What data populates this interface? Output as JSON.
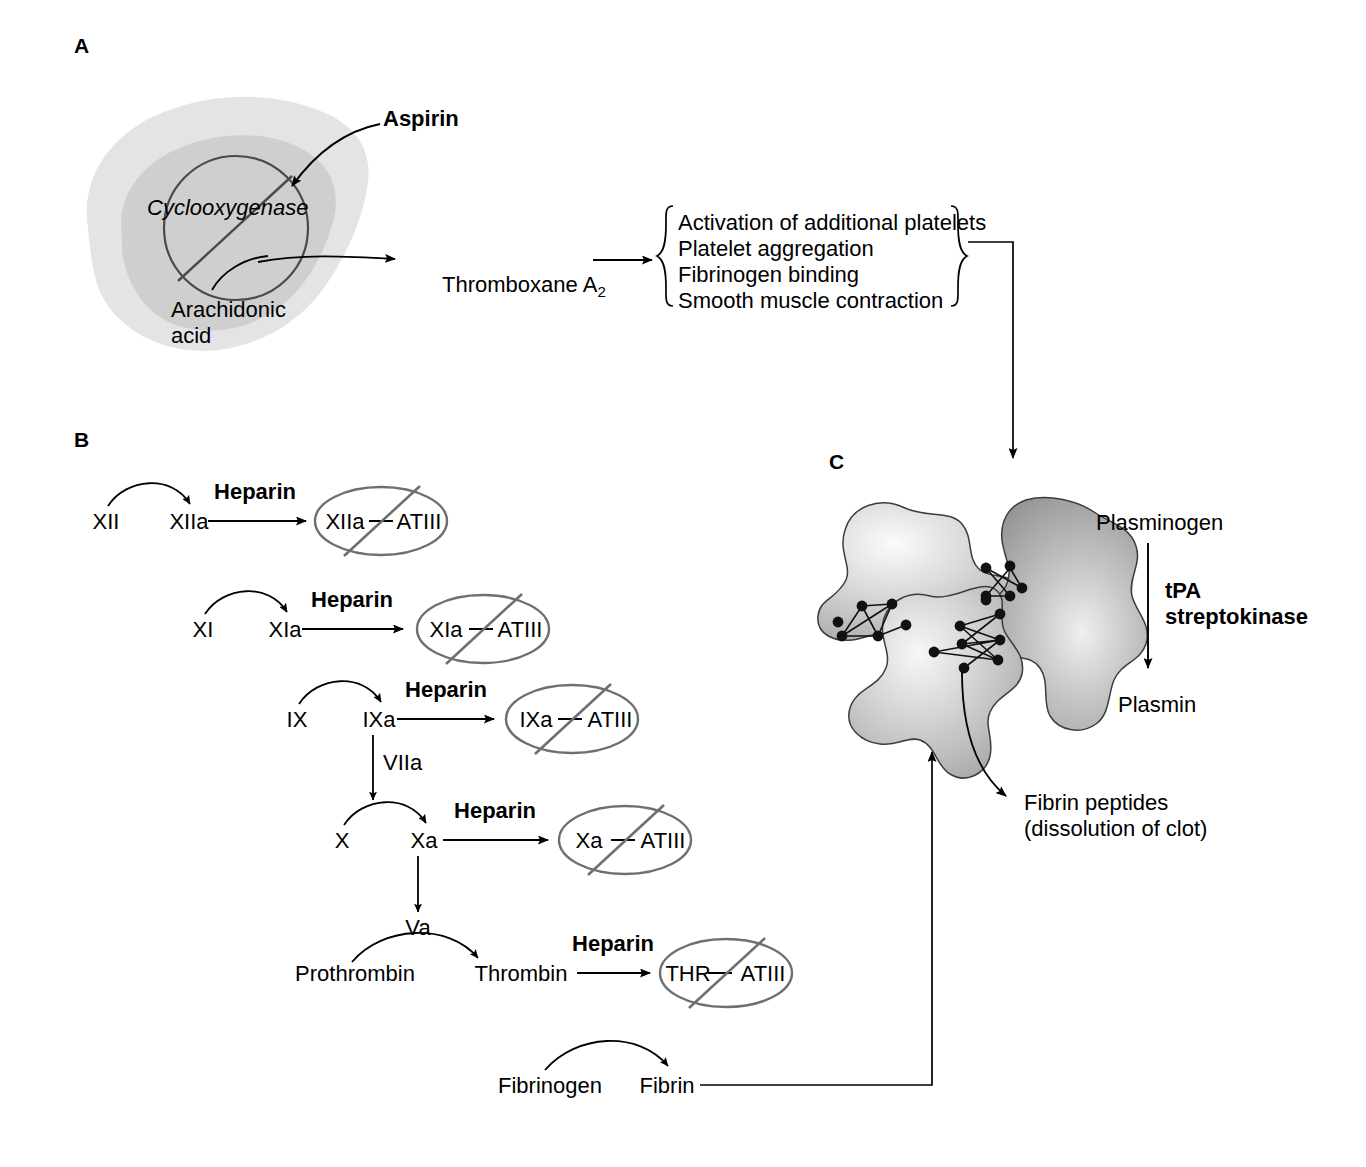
{
  "figure": {
    "panels": [
      {
        "id": "A",
        "label": "A"
      },
      {
        "id": "B",
        "label": "B"
      },
      {
        "id": "C",
        "label": "C"
      }
    ]
  },
  "panelA": {
    "letter": "A",
    "drug": "Aspirin",
    "enzyme": "Cyclooxygenase",
    "substrate_line1": "Arachidonic",
    "substrate_line2": "acid",
    "product": "Thromboxane A",
    "product_subscript": "2",
    "effects": [
      "Activation of additional platelets",
      "Platelet aggregation",
      "Fibrinogen binding",
      "Smooth muscle contraction"
    ]
  },
  "panelB": {
    "letter": "B",
    "drug": "Heparin",
    "inhibitor": "ATIII",
    "cofactor_VIIa": "VIIa",
    "cofactor_Va": "Va",
    "rows": [
      {
        "zymogen": "XII",
        "active": "XIIa",
        "drug": "Heparin",
        "complex_left": "XIIa",
        "complex_right": "ATIII"
      },
      {
        "zymogen": "XI",
        "active": "XIa",
        "drug": "Heparin",
        "complex_left": "XIa",
        "complex_right": "ATIII"
      },
      {
        "zymogen": "IX",
        "active": "IXa",
        "drug": "Heparin",
        "complex_left": "IXa",
        "complex_right": "ATIII"
      },
      {
        "zymogen": "X",
        "active": "Xa",
        "drug": "Heparin",
        "complex_left": "Xa",
        "complex_right": "ATIII"
      },
      {
        "zymogen": "Prothrombin",
        "active": "Thrombin",
        "drug": "Heparin",
        "complex_left": "THR",
        "complex_right": "ATIII"
      },
      {
        "zymogen": "Fibrinogen",
        "active": "Fibrin",
        "drug": "",
        "complex_left": "",
        "complex_right": ""
      }
    ]
  },
  "panelC": {
    "letter": "C",
    "precursor": "Plasminogen",
    "drugs_line1": "tPA",
    "drugs_line2": "streptokinase",
    "enzyme": "Plasmin",
    "product_line1": "Fibrin peptides",
    "product_line2": "(dissolution of clot)"
  },
  "colors": {
    "ink": "#000000",
    "ellipse_gray": "#6f6f6f",
    "cell_outer": "#e2e2e2",
    "cell_inner": "#cfcfcf",
    "clot_light": "#f2f2f2",
    "clot_mid": "#bdbdbd",
    "clot_dark": "#9a9a9a",
    "background": "#ffffff"
  }
}
